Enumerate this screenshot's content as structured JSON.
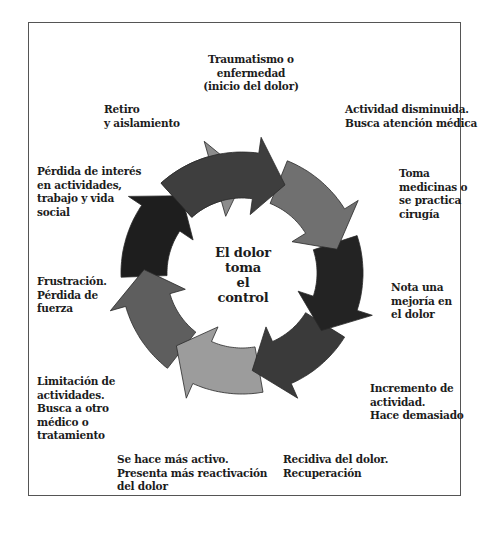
{
  "diagram": {
    "type": "cycle",
    "title": "El dolor\ntoma\nel\ncontrol",
    "colors": {
      "frame": "#555555",
      "background": "#ffffff",
      "text": "#1c1c1c"
    },
    "steps": [
      {
        "id": 1,
        "label": "Traumatismo o\nenfermedad\n(inicio del dolor)",
        "color": "#3e3e3e"
      },
      {
        "id": 2,
        "label": "Actividad disminuida.\nBusca atención médica",
        "color": "#707070"
      },
      {
        "id": 3,
        "label": "Toma\nmedicinas o\nse practica\ncirugía",
        "color": "#232323"
      },
      {
        "id": 4,
        "label": "Nota una\nmejoría en\nel dolor",
        "color": "#3a3a3a"
      },
      {
        "id": 5,
        "label": "Incremento de\nactividad.\nHace demasiado",
        "color": "#9c9c9c"
      },
      {
        "id": 6,
        "label": "Recidiva del dolor.\nRecuperación",
        "color": "#5e5e5e"
      },
      {
        "id": 7,
        "label": "Se hace más activo.\nPresenta más reactivación\ndel dolor",
        "color": "#1e1e1e"
      },
      {
        "id": 8,
        "label": "Limitación de\nactividades.\nBusca a otro\nmédico o\ntratamiento",
        "color": "#8c8c8c"
      },
      {
        "id": 9,
        "label": "Frustración.\nPérdida de\nfuerza"
      },
      {
        "id": 10,
        "label": "Pérdida de interés\nen actividades,\ntrabajo y vida\nsocial"
      },
      {
        "id": 11,
        "label": "Retiro\ny aislamiento"
      }
    ]
  }
}
